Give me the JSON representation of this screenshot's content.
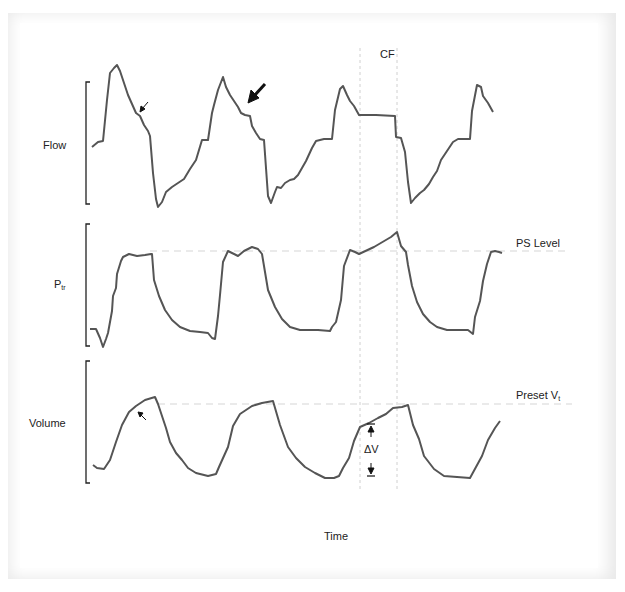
{
  "figure": {
    "type": "ventilator-waveform-diagram",
    "panels": [
      {
        "id": "flow",
        "label": "Flow"
      },
      {
        "id": "pressure",
        "label": "P",
        "label_sub": "tr",
        "reference_line_label": "PS Level"
      },
      {
        "id": "volume",
        "label": "Volume",
        "reference_line_label": "Preset V",
        "reference_line_label_sub": "t"
      }
    ],
    "annotations": {
      "cycle_marker": "CF",
      "delta_volume": "ΔV",
      "x_axis_label": "Time"
    },
    "colors": {
      "trace": "#555555",
      "dashed_line": "#cccccc",
      "frame": "#e9e9e9",
      "text": "#222222"
    }
  }
}
